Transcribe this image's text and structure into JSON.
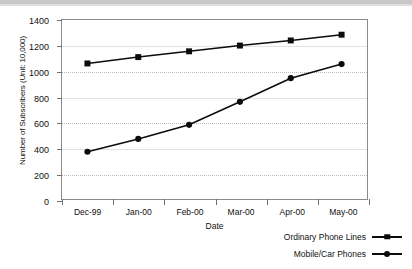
{
  "chart_data": {
    "type": "line",
    "title": "",
    "xlabel": "Date",
    "ylabel": "Number of Subscribers (Unit: 10,000)",
    "categories": [
      "Dec-99",
      "Jan-00",
      "Feb-00",
      "Mar-00",
      "Apr-00",
      "May-00"
    ],
    "ylim": [
      0,
      1400
    ],
    "yticks": [
      0,
      200,
      400,
      600,
      800,
      1000,
      1200,
      1400
    ],
    "ytick_labels": [
      "0",
      "200",
      "400",
      "600",
      "800",
      "1000",
      "1200",
      "1400"
    ],
    "grid": true,
    "legend_position": "bottom-right",
    "series": [
      {
        "name": "Ordinary Phone Lines",
        "marker": "square",
        "color": "#0c0c0c",
        "values": [
          1060,
          1110,
          1155,
          1200,
          1240,
          1285
        ]
      },
      {
        "name": "Mobile/Car Phones",
        "marker": "circle",
        "color": "#0c0c0c",
        "values": [
          370,
          470,
          580,
          760,
          945,
          1055
        ]
      }
    ]
  },
  "legend": {
    "items": [
      {
        "label": "Ordinary Phone Lines",
        "marker": "square"
      },
      {
        "label": "Mobile/Car Phones",
        "marker": "circle"
      }
    ]
  }
}
